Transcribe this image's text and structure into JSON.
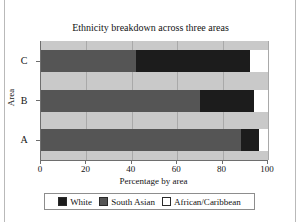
{
  "chart_data": {
    "type": "bar",
    "orientation": "horizontal",
    "stacked": true,
    "title": "Ethnicity breakdown across three areas",
    "xlabel": "Percentage by area",
    "ylabel": "Area",
    "categories": [
      "A",
      "B",
      "C"
    ],
    "category_order_top_to_bottom": [
      "C",
      "B",
      "A"
    ],
    "xlim": [
      0,
      100
    ],
    "xticks": [
      0,
      20,
      40,
      60,
      80,
      100
    ],
    "xtick_labels": [
      "0",
      "20",
      "40",
      "60",
      "80",
      "100"
    ],
    "grid": true,
    "legend_position": "bottom",
    "series": [
      {
        "name": "White",
        "color": "#1c1c1c",
        "values": [
          88,
          70,
          42
        ]
      },
      {
        "name": "South Asian",
        "color": "#555555",
        "values": [
          8,
          24,
          47
        ]
      },
      {
        "name": "African/Caribbean",
        "color": "#ffffff",
        "values": [
          4,
          6,
          11
        ]
      }
    ],
    "segments_by_category": {
      "A": [
        {
          "series": "South Asian",
          "start": 0,
          "end": 88
        },
        {
          "series": "White",
          "start": 88,
          "end": 96
        },
        {
          "series": "African/Caribbean",
          "start": 96,
          "end": 100
        }
      ],
      "B": [
        {
          "series": "South Asian",
          "start": 0,
          "end": 70
        },
        {
          "series": "White",
          "start": 70,
          "end": 94
        },
        {
          "series": "African/Caribbean",
          "start": 94,
          "end": 100
        }
      ],
      "C": [
        {
          "series": "South Asian",
          "start": 0,
          "end": 42
        },
        {
          "series": "White",
          "start": 42,
          "end": 92
        },
        {
          "series": "African/Caribbean",
          "start": 92,
          "end": 100
        }
      ]
    }
  },
  "legend": {
    "items": [
      {
        "label": "White",
        "color": "#1c1c1c"
      },
      {
        "label": "South Asian",
        "color": "#555555"
      },
      {
        "label": "African/Caribbean",
        "color": "#ffffff"
      }
    ]
  },
  "colors": {
    "plot_background": "#c9c9c9",
    "gridline": "#a9a9a9",
    "axis": "#6e6e6e",
    "text": "#141414",
    "page_background": "#ffffff"
  }
}
